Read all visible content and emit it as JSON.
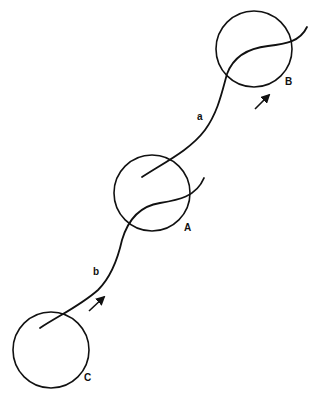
{
  "diagram": {
    "circles": [
      {
        "id": "B",
        "label": "B",
        "cx": 254,
        "cy": 49,
        "r": 38
      },
      {
        "id": "A",
        "label": "A",
        "cx": 152,
        "cy": 193,
        "r": 38
      },
      {
        "id": "C",
        "label": "C",
        "cx": 51,
        "cy": 350,
        "r": 38
      }
    ],
    "curves": [
      {
        "id": "a",
        "label": "a"
      },
      {
        "id": "b",
        "label": "b"
      }
    ],
    "labels": {
      "a": "a",
      "b": "b",
      "A": "A",
      "B": "B",
      "C": "C"
    },
    "arrows": [
      {
        "name": "direction-arrow-a",
        "direction": "up-right"
      },
      {
        "name": "direction-arrow-b",
        "direction": "up-right"
      }
    ],
    "stroke_color": "#111111",
    "background": "#ffffff"
  }
}
